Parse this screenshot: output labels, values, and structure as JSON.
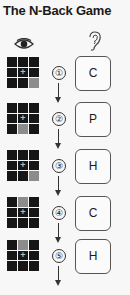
{
  "title": "The N-Back Game",
  "icons": {
    "visual": "eye-icon",
    "audio": "ear-icon"
  },
  "colors": {
    "cell": "#161616",
    "highlight": "#8c8c8c",
    "background": "#f7f7f7"
  },
  "steps": [
    {
      "number": "①",
      "letter": "C",
      "highlight_cell": 8
    },
    {
      "number": "②",
      "letter": "P",
      "highlight_cell": 7
    },
    {
      "number": "③",
      "letter": "H",
      "highlight_cell": 8
    },
    {
      "number": "④",
      "letter": "C",
      "highlight_cell": 1
    },
    {
      "number": "⑤",
      "letter": "H",
      "highlight_cell": 1
    }
  ]
}
